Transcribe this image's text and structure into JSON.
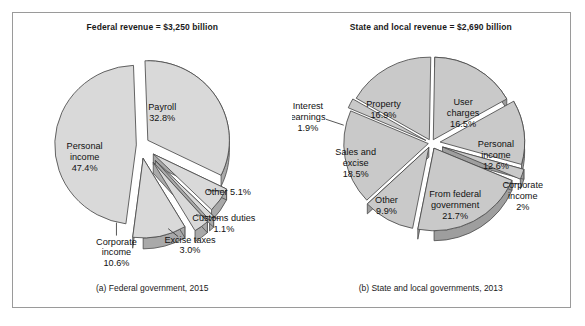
{
  "figure": {
    "border_color": "#9a9a9a",
    "background": "#ffffff"
  },
  "panels": [
    {
      "id": "federal",
      "title": "Federal revenue = $3,250 billion",
      "caption": "(a) Federal government, 2015"
    },
    {
      "id": "state_local",
      "title": "State and local revenue = $2,690 billion",
      "caption": "(b) State and local governments, 2013"
    }
  ],
  "chart_data": [
    {
      "type": "pie",
      "title": "Federal revenue = $3,250 billion",
      "subtitle": "(a) Federal government, 2015",
      "total_label": "$3,250 billion",
      "units": "percent of total revenue",
      "exploded": true,
      "three_d": true,
      "fill_color": "#d9d9d9",
      "side_color": "#a9a9a9",
      "edge_color": "#4a4a4a",
      "legend": "none (direct labels)",
      "labels": [
        "Personal income",
        "Payroll",
        "Other",
        "Customs duties",
        "Excise taxes",
        "Corporate income"
      ],
      "values": [
        47.4,
        32.8,
        5.1,
        1.1,
        3.0,
        10.6
      ],
      "value_texts": [
        "47.4%",
        "32.8%",
        "5.1%",
        "1.1%",
        "3.0%",
        "10.6%"
      ],
      "slices": [
        {
          "label": "Personal income",
          "value": 47.4,
          "text": "47.4%",
          "label_line1": "Personal",
          "label_line2": "income",
          "label_line3": "47.4%"
        },
        {
          "label": "Payroll",
          "value": 32.8,
          "text": "32.8%",
          "label_line1": "Payroll",
          "label_line2": "32.8%",
          "label_line3": ""
        },
        {
          "label": "Other",
          "value": 5.1,
          "text": "5.1%",
          "label_line1": "Other 5.1%",
          "label_line2": "",
          "label_line3": ""
        },
        {
          "label": "Customs duties",
          "value": 1.1,
          "text": "1.1%",
          "label_line1": "Customs duties",
          "label_line2": "1.1%",
          "label_line3": ""
        },
        {
          "label": "Excise taxes",
          "value": 3.0,
          "text": "3.0%",
          "label_line1": "Excise taxes",
          "label_line2": "3.0%",
          "label_line3": ""
        },
        {
          "label": "Corporate income",
          "value": 10.6,
          "text": "10.6%",
          "label_line1": "Corporate",
          "label_line2": "income",
          "label_line3": "10.6%"
        }
      ]
    },
    {
      "type": "pie",
      "title": "State and local revenue = $2,690 billion",
      "subtitle": "(b) State and local governments, 2013",
      "total_label": "$2,690 billion",
      "units": "percent of total revenue",
      "exploded": true,
      "three_d": true,
      "fill_color": "#c9c9c9",
      "side_color": "#9e9e9e",
      "edge_color": "#4a4a4a",
      "legend": "none (direct labels)",
      "labels": [
        "User charges",
        "Personal income",
        "Corporate income",
        "From federal government",
        "Other",
        "Sales and excise",
        "Interest earnings",
        "Property"
      ],
      "values": [
        16.5,
        12.6,
        2.0,
        21.7,
        9.9,
        18.5,
        1.9,
        16.9
      ],
      "value_texts": [
        "16.5%",
        "12.6%",
        "2%",
        "21.7%",
        "9.9%",
        "18.5%",
        "1.9%",
        "16.9%"
      ],
      "slices": [
        {
          "label": "User charges",
          "value": 16.5,
          "text": "16.5%",
          "label_line1": "User",
          "label_line2": "charges",
          "label_line3": "16.5%"
        },
        {
          "label": "Personal income",
          "value": 12.6,
          "text": "12.6%",
          "label_line1": "Personal",
          "label_line2": "income",
          "label_line3": "12.6%"
        },
        {
          "label": "Corporate income",
          "value": 2.0,
          "text": "2%",
          "label_line1": "Corporate",
          "label_line2": "income",
          "label_line3": "2%"
        },
        {
          "label": "From federal government",
          "value": 21.7,
          "text": "21.7%",
          "label_line1": "From federal",
          "label_line2": "government",
          "label_line3": "21.7%"
        },
        {
          "label": "Other",
          "value": 9.9,
          "text": "9.9%",
          "label_line1": "Other",
          "label_line2": "9.9%",
          "label_line3": ""
        },
        {
          "label": "Sales and excise",
          "value": 18.5,
          "text": "18.5%",
          "label_line1": "Sales and",
          "label_line2": "excise",
          "label_line3": "18.5%"
        },
        {
          "label": "Interest earnings",
          "value": 1.9,
          "text": "1.9%",
          "label_line1": "Interest",
          "label_line2": "earnings",
          "label_line3": "1.9%"
        },
        {
          "label": "Property",
          "value": 16.9,
          "text": "16.9%",
          "label_line1": "Property",
          "label_line2": "16.9%",
          "label_line3": ""
        }
      ]
    }
  ]
}
